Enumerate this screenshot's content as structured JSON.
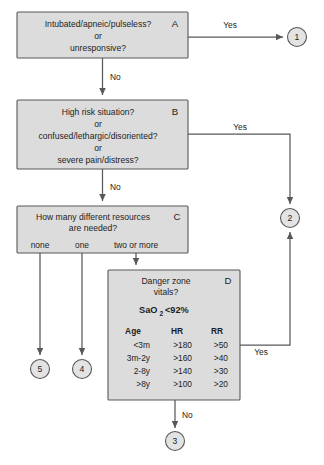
{
  "diagram": {
    "colors": {
      "box_fill": "#dcdcdc",
      "box_stroke": "#58585a",
      "connector": "#58585a",
      "circle_fill": "#e3e3e3",
      "text": "#1d1d1d",
      "background": "#ffffff"
    },
    "boxes": [
      {
        "id": "A",
        "letter": "A",
        "lines": [
          "Intubated/apneic/pulseless?",
          "or",
          "unresponsive?"
        ]
      },
      {
        "id": "B",
        "letter": "B",
        "lines": [
          "High risk situation?",
          "or",
          "confused/lethargic/disoriented?",
          "or",
          "severe pain/distress?"
        ]
      },
      {
        "id": "C",
        "letter": "C",
        "lines": [
          "How many different resources",
          "are needed?"
        ],
        "options": [
          "none",
          "one",
          "two or more"
        ]
      },
      {
        "id": "D",
        "letter": "D",
        "lines": [
          "Danger zone",
          "vitals?"
        ],
        "sao2_label": "SaO",
        "sao2_sub": "2",
        "sao2_value": "<92%",
        "table": {
          "headers": [
            "Age",
            "HR",
            "RR"
          ],
          "rows": [
            [
              "<3m",
              ">180",
              ">50"
            ],
            [
              "3m-2y",
              ">160",
              ">40"
            ],
            [
              "2-8y",
              ">140",
              ">30"
            ],
            [
              ">8y",
              ">100",
              ">20"
            ]
          ]
        }
      }
    ],
    "edge_labels": {
      "a_yes": "Yes",
      "a_no": "No",
      "b_yes": "Yes",
      "b_no": "No",
      "d_yes": "Yes",
      "d_no": "No"
    },
    "outcomes": [
      {
        "id": "out1",
        "label": "1"
      },
      {
        "id": "out2",
        "label": "2"
      },
      {
        "id": "out3",
        "label": "3"
      },
      {
        "id": "out4",
        "label": "4"
      },
      {
        "id": "out5",
        "label": "5"
      }
    ]
  }
}
